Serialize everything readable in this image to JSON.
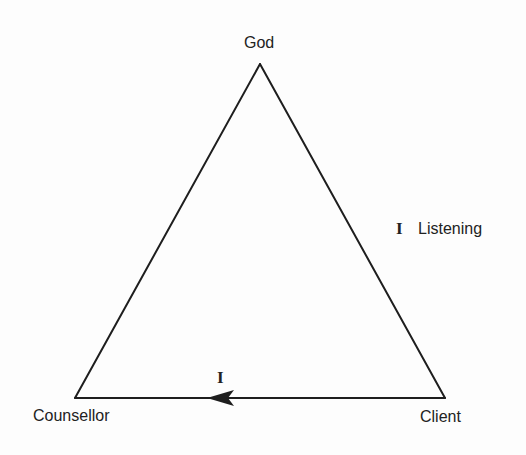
{
  "diagram": {
    "type": "triangle",
    "colors": {
      "line": "#1e1e1e",
      "text": "#222222",
      "background": "#fdfdfd"
    },
    "vertices": {
      "top": {
        "label": "God"
      },
      "bottom_left": {
        "label": "Counsellor"
      },
      "bottom_right": {
        "label": "Client"
      }
    },
    "edges": {
      "right": {
        "from": "God",
        "to": "Client",
        "numeral": "I",
        "label": "Listening"
      },
      "bottom": {
        "from": "Client",
        "to": "Counsellor",
        "numeral": "I",
        "arrow": "pointing-left"
      },
      "left": {
        "from": "Counsellor",
        "to": "God"
      }
    }
  }
}
